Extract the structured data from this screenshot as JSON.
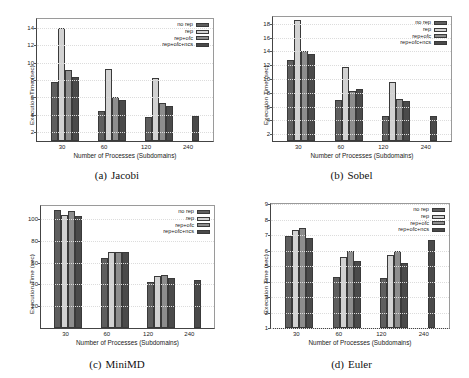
{
  "figure": {
    "series_names": [
      "no rep",
      "rep",
      "rep+ofc",
      "rep+ofc+ncs"
    ],
    "series_colors": [
      "#5e5e5e",
      "#d2d2d2",
      "#8d8d8d",
      "#4a4a4a"
    ],
    "xlabel": "Number of Processes (Subdomains)",
    "ylabel": "Execution Time (sec)",
    "categories": [
      "30",
      "60",
      "120",
      "240"
    ]
  },
  "chart_data": [
    {
      "type": "bar",
      "panel": "a",
      "caption_tag": "(a)",
      "caption_text": "Jacobi",
      "title": "",
      "xlabel": "Number of Processes (Subdomains)",
      "ylabel": "Execution Time (sec)",
      "categories": [
        "30",
        "60",
        "120",
        "240"
      ],
      "yticks": [
        2,
        4,
        6,
        8,
        10,
        12,
        14
      ],
      "ylim": [
        1,
        15
      ],
      "grid": true,
      "legend_position": "top-right",
      "series": [
        {
          "name": "no rep",
          "values": [
            7.8,
            4.5,
            3.8,
            null
          ]
        },
        {
          "name": "rep",
          "values": [
            14.0,
            9.3,
            8.2,
            null
          ]
        },
        {
          "name": "rep+ofc",
          "values": [
            9.2,
            6.0,
            5.4,
            null
          ]
        },
        {
          "name": "rep+ofc+ncs",
          "values": [
            8.4,
            5.7,
            5.0,
            3.9
          ]
        }
      ]
    },
    {
      "type": "bar",
      "panel": "b",
      "caption_tag": "(b)",
      "caption_text": "Sobel",
      "title": "",
      "xlabel": "Number of Processes (Subdomains)",
      "ylabel": "Execution Time (sec)",
      "categories": [
        "30",
        "60",
        "120",
        "240"
      ],
      "yticks": [
        2,
        4,
        6,
        8,
        10,
        12,
        14,
        16,
        18
      ],
      "ylim": [
        1,
        19
      ],
      "grid": true,
      "legend_position": "top-right",
      "series": [
        {
          "name": "no rep",
          "values": [
            12.8,
            7.0,
            4.7,
            null
          ]
        },
        {
          "name": "rep",
          "values": [
            18.5,
            11.8,
            9.5,
            null
          ]
        },
        {
          "name": "rep+ofc",
          "values": [
            14.1,
            8.3,
            7.1,
            null
          ]
        },
        {
          "name": "rep+ofc+ncs",
          "values": [
            13.7,
            8.6,
            6.8,
            4.6
          ]
        }
      ]
    },
    {
      "type": "bar",
      "panel": "c",
      "caption_tag": "(c)",
      "caption_text": "MiniMD",
      "title": "",
      "xlabel": "Number of Processes (Subdomains)",
      "ylabel": "Execution Time (sec)",
      "categories": [
        "30",
        "60",
        "120",
        "240"
      ],
      "yticks": [
        20,
        40,
        60,
        80,
        100
      ],
      "ylim": [
        0,
        112
      ],
      "grid": true,
      "legend_position": "top-right",
      "series": [
        {
          "name": "no rep",
          "values": [
            108,
            64.5,
            42.5,
            null
          ]
        },
        {
          "name": "rep",
          "values": [
            104,
            70,
            48,
            null
          ]
        },
        {
          "name": "rep+ofc",
          "values": [
            107,
            70,
            48.5,
            null
          ]
        },
        {
          "name": "rep+ofc+ncs",
          "values": [
            103,
            70,
            46,
            44.5
          ]
        }
      ]
    },
    {
      "type": "bar",
      "panel": "d",
      "caption_tag": "(d)",
      "caption_text": "Euler",
      "title": "",
      "xlabel": "Number of Processes (Subdomains)",
      "ylabel": "Execution Time (sec)",
      "categories": [
        "30",
        "60",
        "120",
        "240"
      ],
      "yticks": [
        1,
        2,
        3,
        4,
        5,
        6,
        7,
        8,
        9
      ],
      "ylim": [
        1,
        9
      ],
      "grid": true,
      "legend_position": "top-right",
      "series": [
        {
          "name": "no rep",
          "values": [
            6.95,
            4.3,
            4.25,
            null
          ]
        },
        {
          "name": "rep",
          "values": [
            7.3,
            5.6,
            5.7,
            null
          ]
        },
        {
          "name": "rep+ofc",
          "values": [
            7.45,
            6.0,
            6.0,
            null
          ]
        },
        {
          "name": "rep+ofc+ncs",
          "values": [
            6.8,
            5.35,
            5.2,
            6.7
          ]
        }
      ]
    }
  ]
}
